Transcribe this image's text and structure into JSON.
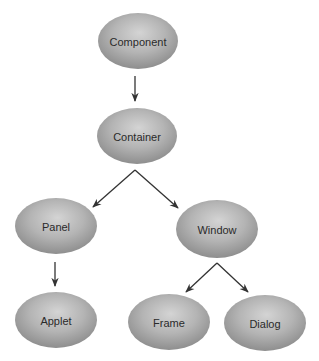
{
  "diagram": {
    "type": "class-hierarchy-tree",
    "colors": {
      "node_fill_light": "#d2d2d2",
      "node_fill_mid": "#b0b0b0",
      "node_fill_dark": "#8c8c8c",
      "edge": "#333333",
      "text": "#2a2a2a",
      "background": "#ffffff"
    },
    "nodes": [
      {
        "id": "component",
        "label": "Component",
        "cx": 138,
        "cy": 41,
        "rx": 40,
        "ry": 28
      },
      {
        "id": "container",
        "label": "Container",
        "cx": 137,
        "cy": 136,
        "rx": 40,
        "ry": 28
      },
      {
        "id": "panel",
        "label": "Panel",
        "cx": 56,
        "cy": 226,
        "rx": 41,
        "ry": 28
      },
      {
        "id": "window",
        "label": "Window",
        "cx": 217,
        "cy": 229,
        "rx": 41,
        "ry": 29
      },
      {
        "id": "applet",
        "label": "Applet",
        "cx": 56,
        "cy": 320,
        "rx": 41,
        "ry": 28
      },
      {
        "id": "frame",
        "label": "Frame",
        "cx": 169,
        "cy": 322,
        "rx": 41,
        "ry": 28
      },
      {
        "id": "dialog",
        "label": "Dialog",
        "cx": 265,
        "cy": 323,
        "rx": 41,
        "ry": 28
      }
    ],
    "edges": [
      {
        "from": "component",
        "to": "container",
        "x1": 135,
        "y1": 76,
        "x2": 135,
        "y2": 101
      },
      {
        "from": "container",
        "to": "panel",
        "x1": 135,
        "y1": 170,
        "x2": 93,
        "y2": 207
      },
      {
        "from": "container",
        "to": "window",
        "x1": 135,
        "y1": 170,
        "x2": 178,
        "y2": 208
      },
      {
        "from": "panel",
        "to": "applet",
        "x1": 55,
        "y1": 262,
        "x2": 55,
        "y2": 286
      },
      {
        "from": "window",
        "to": "frame",
        "x1": 217,
        "y1": 263,
        "x2": 186,
        "y2": 292
      },
      {
        "from": "window",
        "to": "dialog",
        "x1": 217,
        "y1": 263,
        "x2": 248,
        "y2": 292
      }
    ]
  }
}
